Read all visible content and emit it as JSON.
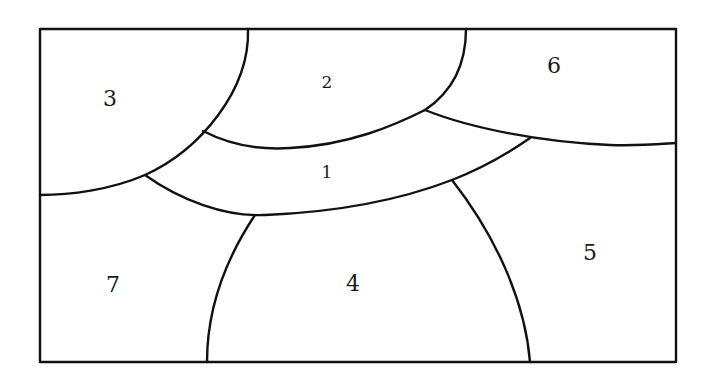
{
  "diagram": {
    "type": "region-map",
    "regions": [
      {
        "id": "region-1",
        "label": "1"
      },
      {
        "id": "region-2",
        "label": "2"
      },
      {
        "id": "region-3",
        "label": "3"
      },
      {
        "id": "region-4",
        "label": "4"
      },
      {
        "id": "region-5",
        "label": "5"
      },
      {
        "id": "region-6",
        "label": "6"
      },
      {
        "id": "region-7",
        "label": "7"
      }
    ],
    "adjacency": [
      [
        "1",
        "2"
      ],
      [
        "1",
        "3"
      ],
      [
        "1",
        "4"
      ],
      [
        "1",
        "5"
      ],
      [
        "1",
        "6"
      ],
      [
        "1",
        "7"
      ],
      [
        "2",
        "3"
      ],
      [
        "2",
        "6"
      ],
      [
        "3",
        "7"
      ],
      [
        "4",
        "5"
      ],
      [
        "4",
        "7"
      ],
      [
        "5",
        "6"
      ]
    ],
    "colors": {
      "stroke": "#111111",
      "background": "#ffffff",
      "text": "#1a1a1a"
    }
  }
}
